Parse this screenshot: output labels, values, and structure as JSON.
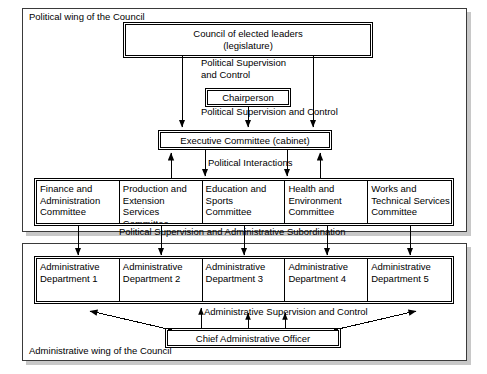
{
  "diagram": {
    "political_wing": {
      "label": "Political wing of the Council",
      "council": {
        "label": "Council of elected leaders\n(legislature)"
      },
      "chairperson": {
        "label": "Chairperson"
      },
      "executive": {
        "label": "Executive Committee (cabinet)"
      },
      "committees": [
        {
          "label": "Finance and\nAdministration\nCommittee"
        },
        {
          "label": "Production and\nExtension Services\nCommittee"
        },
        {
          "label": "Education and\nSports\nCommittee"
        },
        {
          "label": "Health and\nEnvironment\nCommittee"
        },
        {
          "label": "Works and\nTechnical Services\nCommittee"
        }
      ]
    },
    "administrative_wing": {
      "label": "Administrative wing of the Council",
      "departments": [
        {
          "label": "Administrative\nDepartment 1"
        },
        {
          "label": "Administrative\nDepartment 2"
        },
        {
          "label": "Administrative\nDepartment 3"
        },
        {
          "label": "Administrative\nDepartment 4"
        },
        {
          "label": "Administrative\nDepartment 5"
        }
      ],
      "chief_officer": {
        "label": "Chief Administrative Officer"
      }
    },
    "relations": {
      "political_supervision_and_control": "Political Supervision\nand Control",
      "political_supervision_and_control_inline": "Political Supervision and Control",
      "political_interactions": "Political Interactions",
      "political_supervision_and_administrative_subordination": "Political Supervision and Administrative Subordination",
      "administrative_supervision_and_control": "Administrative Supervision and Control"
    },
    "colors": {
      "line": "#000000",
      "shadow": "#c8c8c8",
      "frame": "#3a3a3a",
      "background": "#ffffff"
    }
  }
}
